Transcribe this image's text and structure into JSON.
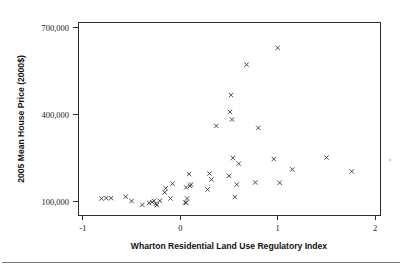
{
  "figure": {
    "background_color": "#ffffff",
    "frame_color": "#2b2b2b",
    "marker_color": "#3a3a3a",
    "marker_symbol": "x"
  },
  "chart_data": {
    "type": "scatter",
    "title": "",
    "xlabel": "Wharton Residential Land Use Regulatory Index",
    "ylabel": "2005 Mean House Price (2000$)",
    "xlim": [
      -1.05,
      2.05
    ],
    "ylim": [
      55000,
      720000
    ],
    "xticks": [
      -1,
      0,
      1,
      2
    ],
    "xtick_labels": [
      "-1",
      "0",
      "1",
      "2"
    ],
    "yticks": [
      100000,
      400000,
      700000
    ],
    "ytick_labels": [
      "100,000",
      "400,000",
      "700,000"
    ],
    "grid": false,
    "legend": false,
    "n_points": 45,
    "points": [
      {
        "x": -0.81,
        "y": 112000
      },
      {
        "x": -0.76,
        "y": 113000
      },
      {
        "x": -0.71,
        "y": 113000
      },
      {
        "x": -0.56,
        "y": 118000
      },
      {
        "x": -0.5,
        "y": 103000
      },
      {
        "x": -0.39,
        "y": 90000
      },
      {
        "x": -0.32,
        "y": 97000
      },
      {
        "x": -0.29,
        "y": 99000
      },
      {
        "x": -0.27,
        "y": 104000
      },
      {
        "x": -0.25,
        "y": 94000
      },
      {
        "x": -0.24,
        "y": 89000
      },
      {
        "x": -0.21,
        "y": 104000
      },
      {
        "x": -0.16,
        "y": 133000
      },
      {
        "x": -0.15,
        "y": 147000
      },
      {
        "x": -0.1,
        "y": 112000
      },
      {
        "x": -0.08,
        "y": 163000
      },
      {
        "x": 0.05,
        "y": 98000
      },
      {
        "x": 0.06,
        "y": 97000
      },
      {
        "x": 0.06,
        "y": 150000
      },
      {
        "x": 0.07,
        "y": 112000
      },
      {
        "x": 0.09,
        "y": 196000
      },
      {
        "x": 0.1,
        "y": 155000
      },
      {
        "x": 0.11,
        "y": 160000
      },
      {
        "x": 0.28,
        "y": 143000
      },
      {
        "x": 0.3,
        "y": 198000
      },
      {
        "x": 0.32,
        "y": 177000
      },
      {
        "x": 0.37,
        "y": 362000
      },
      {
        "x": 0.5,
        "y": 190000
      },
      {
        "x": 0.51,
        "y": 410000
      },
      {
        "x": 0.52,
        "y": 468000
      },
      {
        "x": 0.53,
        "y": 384000
      },
      {
        "x": 0.54,
        "y": 252000
      },
      {
        "x": 0.56,
        "y": 117000
      },
      {
        "x": 0.58,
        "y": 160000
      },
      {
        "x": 0.6,
        "y": 232000
      },
      {
        "x": 0.68,
        "y": 573000
      },
      {
        "x": 0.77,
        "y": 167000
      },
      {
        "x": 0.8,
        "y": 355000
      },
      {
        "x": 0.96,
        "y": 248000
      },
      {
        "x": 1.0,
        "y": 631000
      },
      {
        "x": 1.02,
        "y": 166000
      },
      {
        "x": 1.15,
        "y": 212000
      },
      {
        "x": 1.5,
        "y": 253000
      },
      {
        "x": 1.76,
        "y": 205000
      }
    ]
  }
}
